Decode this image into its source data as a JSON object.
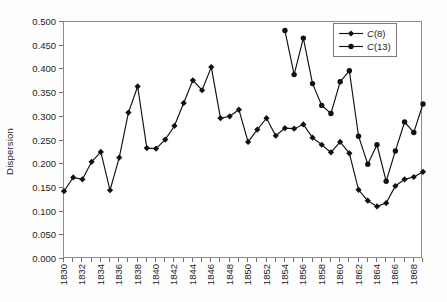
{
  "chart_data": {
    "type": "line",
    "title": "",
    "xlabel": "",
    "ylabel": "Dispersion",
    "ylim": [
      0.0,
      0.5
    ],
    "ytick_step": 0.05,
    "yticks": [
      "0.000",
      "0.050",
      "0.100",
      "0.150",
      "0.200",
      "0.250",
      "0.300",
      "0.350",
      "0.400",
      "0.450",
      "0.500"
    ],
    "xlim": [
      1830,
      1869
    ],
    "xtick_step": 1,
    "xtick_label_step": 2,
    "x": [
      1830,
      1831,
      1832,
      1833,
      1834,
      1835,
      1836,
      1837,
      1838,
      1839,
      1840,
      1841,
      1842,
      1843,
      1844,
      1845,
      1846,
      1847,
      1848,
      1849,
      1850,
      1851,
      1852,
      1853,
      1854,
      1855,
      1856,
      1857,
      1858,
      1859,
      1860,
      1861,
      1862,
      1863,
      1864,
      1865,
      1866,
      1867,
      1868,
      1869
    ],
    "xticklabels": [
      "1830",
      "1832",
      "1834",
      "1836",
      "1838",
      "1840",
      "1842",
      "1844",
      "1846",
      "1848",
      "1850",
      "1852",
      "1854",
      "1856",
      "1858",
      "1860",
      "1862",
      "1864",
      "1866",
      "1868"
    ],
    "grid": false,
    "legend_position": "top-right",
    "series": [
      {
        "name": "C(8)",
        "marker": "diamond",
        "color": "#111111",
        "x": [
          1830,
          1831,
          1832,
          1833,
          1834,
          1835,
          1836,
          1837,
          1838,
          1839,
          1840,
          1841,
          1842,
          1843,
          1844,
          1845,
          1846,
          1847,
          1848,
          1849,
          1850,
          1851,
          1852,
          1853,
          1854,
          1855,
          1856,
          1857,
          1858,
          1859,
          1860,
          1861,
          1862,
          1863,
          1864,
          1865,
          1866,
          1867,
          1868,
          1869
        ],
        "values": [
          0.143,
          0.172,
          0.168,
          0.205,
          0.226,
          0.145,
          0.214,
          0.309,
          0.364,
          0.234,
          0.233,
          0.252,
          0.281,
          0.329,
          0.377,
          0.356,
          0.405,
          0.297,
          0.301,
          0.315,
          0.247,
          0.273,
          0.297,
          0.26,
          0.276,
          0.275,
          0.284,
          0.256,
          0.241,
          0.225,
          0.247,
          0.223,
          0.146,
          0.123,
          0.111,
          0.118,
          0.154,
          0.168,
          0.173,
          0.184
        ]
      },
      {
        "name": "C(13)",
        "marker": "circle",
        "color": "#111111",
        "x": [
          1854,
          1855,
          1856,
          1857,
          1858,
          1859,
          1860,
          1861,
          1862,
          1863,
          1864,
          1865,
          1866,
          1867,
          1868,
          1869
        ],
        "values": [
          0.482,
          0.389,
          0.466,
          0.37,
          0.324,
          0.307,
          0.374,
          0.397,
          0.259,
          0.2,
          0.241,
          0.164,
          0.228,
          0.289,
          0.267,
          0.327
        ]
      }
    ],
    "legend": [
      {
        "label_prefix": "C",
        "label_suffix": "(8)",
        "marker": "diamond"
      },
      {
        "label_prefix": "C",
        "label_suffix": "(13)",
        "marker": "circle"
      }
    ]
  }
}
